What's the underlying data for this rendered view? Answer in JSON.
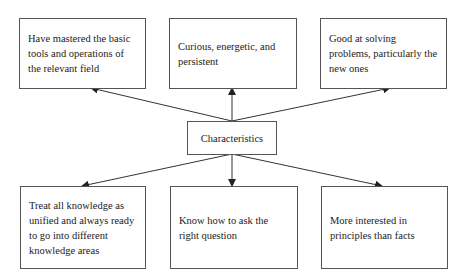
{
  "diagram": {
    "center": {
      "label": "Characteristics"
    },
    "top_boxes": [
      {
        "label": "Have mastered the basic tools and operations of the relevant field"
      },
      {
        "label": "Curious, energetic, and persistent"
      },
      {
        "label": "Good at solving problems, particularly the new ones"
      }
    ],
    "bottom_boxes": [
      {
        "label": "Treat all knowledge as unified and always ready to go into different knowledge areas"
      },
      {
        "label": "Know how to ask the right question"
      },
      {
        "label": "More interested in principles than facts"
      }
    ],
    "colors": {
      "line": "#333333",
      "border": "#555555",
      "text": "#222222"
    }
  }
}
